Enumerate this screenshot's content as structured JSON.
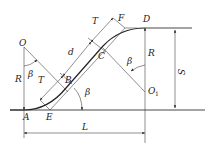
{
  "diagram": {
    "labels": {
      "O": "O",
      "O1": "O",
      "O1_sub": "1",
      "A": "A",
      "B": "B",
      "C": "C",
      "D": "D",
      "E": "E",
      "F": "F",
      "R_left": "R",
      "R_right": "R",
      "beta_O": "β",
      "beta_B": "β",
      "beta_O1": "β",
      "T_lower": "T",
      "T_upper": "T",
      "d": "d",
      "S": "S",
      "L": "L"
    },
    "colors": {
      "line": "#333333",
      "background": "#ffffff"
    }
  }
}
